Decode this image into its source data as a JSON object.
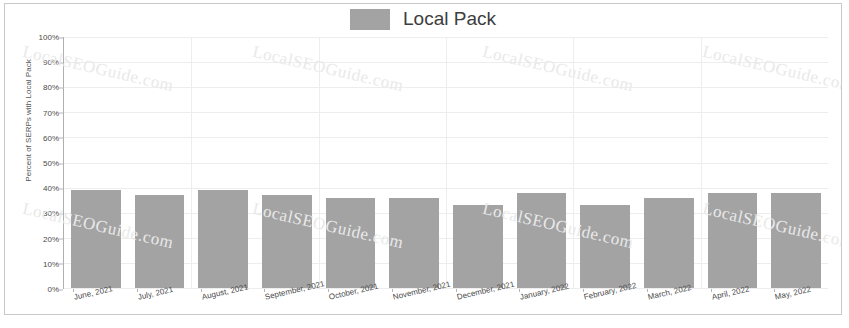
{
  "legend": {
    "label": "Local Pack",
    "swatch_color": "#a3a3a3"
  },
  "watermark": {
    "text": "LocalSEOGuide.com"
  },
  "chart_data": {
    "type": "bar",
    "title": "Local Pack",
    "xlabel": "",
    "ylabel": "Percent of SERPs with Local Pack",
    "ylim": [
      0,
      100
    ],
    "ytick_labels": [
      "100%",
      "90%",
      "80%",
      "70%",
      "60%",
      "50%",
      "40%",
      "30%",
      "20%",
      "10%",
      "0%"
    ],
    "ytick_values": [
      100,
      90,
      80,
      70,
      60,
      50,
      40,
      30,
      20,
      10,
      0
    ],
    "grid": true,
    "legend_position": "top-center",
    "series_color": "#a3a3a3",
    "categories": [
      "June, 2021",
      "July, 2021",
      "August, 2021",
      "September, 2021",
      "October, 2021",
      "November, 2021",
      "December, 2021",
      "January, 2022",
      "February, 2022",
      "March, 2022",
      "April, 2022",
      "May, 2022"
    ],
    "series": [
      {
        "name": "Local Pack",
        "values": [
          39,
          37,
          39,
          37,
          36,
          36,
          33,
          38,
          33,
          36,
          38,
          38
        ]
      }
    ]
  }
}
